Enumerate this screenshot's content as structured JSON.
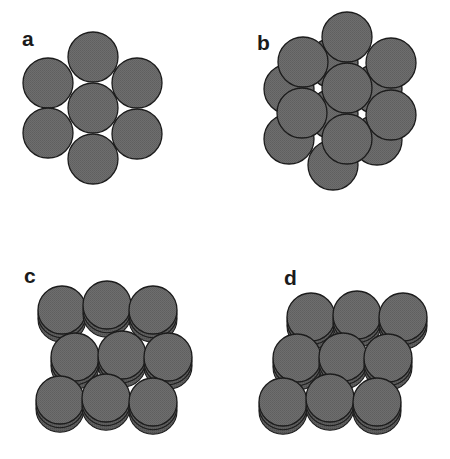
{
  "figure": {
    "colors": {
      "fill": "#6b6b6b",
      "fill_side": "#595959",
      "outline": "#1c1c1c",
      "background": "#ffffff"
    },
    "panels": [
      {
        "label": "a",
        "label_pos": [
          22,
          46
        ],
        "description": "seven circles, single hexagonal layer",
        "radius": 25,
        "layers": [
          {
            "circles": [
              [
                93,
                57
              ],
              [
                48,
                83
              ],
              [
                137,
                83
              ],
              [
                93,
                108
              ],
              [
                48,
                133
              ],
              [
                137,
                134
              ],
              [
                93,
                159
              ]
            ]
          }
        ]
      },
      {
        "label": "b",
        "label_pos": [
          257,
          50
        ],
        "description": "two offset hexagonal layers of seven circles",
        "radius": 25,
        "layers": [
          {
            "circles": [
              [
                333,
                63
              ],
              [
                289,
                89
              ],
              [
                377,
                89
              ],
              [
                333,
                114
              ],
              [
                289,
                139
              ],
              [
                377,
                140
              ],
              [
                333,
                165
              ]
            ]
          },
          {
            "circles": [
              [
                347,
                37
              ],
              [
                303,
                62
              ],
              [
                391,
                63
              ],
              [
                347,
                88
              ],
              [
                302,
                113
              ],
              [
                391,
                115
              ],
              [
                347,
                139
              ]
            ]
          }
        ]
      },
      {
        "label": "c",
        "label_pos": [
          24,
          283
        ],
        "description": "stacked discs, 3x3 staggered arrangement",
        "radius": 24,
        "thickness": 7,
        "stack": 2,
        "rows": [
          [
            [
              62,
              310
            ],
            [
              107,
              305
            ],
            [
              153,
              310
            ]
          ],
          [
            [
              75,
              357
            ],
            [
              122,
              355
            ],
            [
              168,
              357
            ]
          ],
          [
            [
              60,
              400
            ],
            [
              106,
              398
            ],
            [
              153,
              402
            ]
          ]
        ]
      },
      {
        "label": "d",
        "label_pos": [
          284,
          285
        ],
        "description": "stacked discs, 3x3 sheared arrangement",
        "radius": 24,
        "thickness": 7,
        "stack": 2,
        "rows": [
          [
            [
              311,
              317
            ],
            [
              357,
              315
            ],
            [
              403,
              317
            ]
          ],
          [
            [
              297,
              358
            ],
            [
              343,
              357
            ],
            [
              388,
              358
            ]
          ],
          [
            [
              283,
              402
            ],
            [
              330,
              398
            ],
            [
              377,
              402
            ]
          ]
        ]
      }
    ]
  }
}
